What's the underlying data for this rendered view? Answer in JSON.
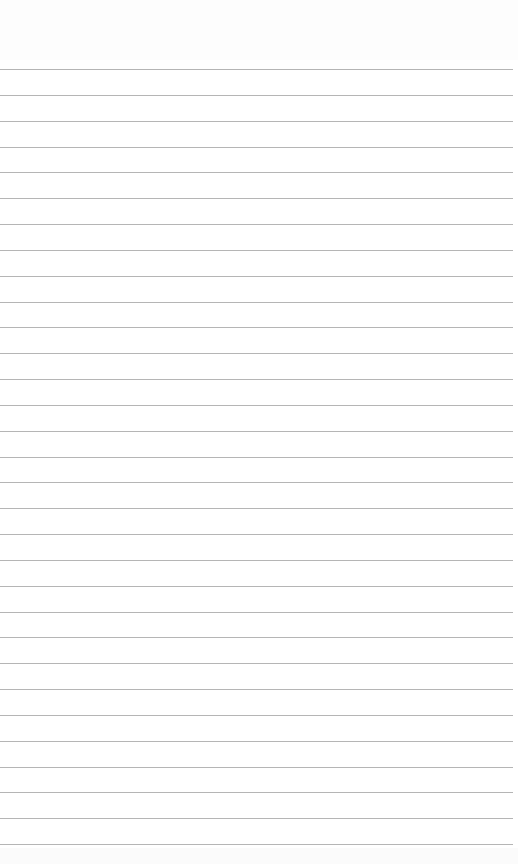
{
  "page": {
    "type": "ruled-notepad",
    "background_color": "#ffffff",
    "rule_color": "#a8a8a8",
    "rule_count": 31,
    "first_rule_y": 69,
    "last_rule_y": 844,
    "rule_width": 513,
    "text_lines": []
  }
}
